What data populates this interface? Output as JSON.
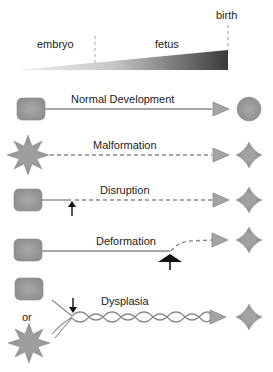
{
  "timeline": {
    "stages": [
      {
        "label": "embryo"
      },
      {
        "label": "fetus"
      },
      {
        "label": "birth"
      }
    ]
  },
  "rows": [
    {
      "label": "Normal Development",
      "start_shape": "rounded-square",
      "line": "solid",
      "end_shape": "circle"
    },
    {
      "label": "Malformation",
      "start_shape": "star",
      "line": "dashed",
      "end_shape": "diamond"
    },
    {
      "label": "Disruption",
      "start_shape": "rounded-square",
      "line": "solid-then-dashed",
      "event_marker": "small-up-arrow",
      "end_shape": "diamond"
    },
    {
      "label": "Deformation",
      "start_shape": "rounded-square",
      "line": "solid-then-dashed-curve",
      "event_marker": "large-up-arrow",
      "end_shape": "diamond"
    },
    {
      "label": "Dysplasia",
      "start_shape": "rounded-square or star",
      "or_label": "or",
      "line": "wavy-twisted",
      "event_marker": "down-arrow",
      "end_shape": "diamond"
    }
  ],
  "colors": {
    "shape_fill": "#9a9a9a",
    "line": "#8a8a8a",
    "arrow_marker": "#111111",
    "gradient_dark": "#3a3a3a",
    "gradient_light": "#e0e0e0"
  }
}
